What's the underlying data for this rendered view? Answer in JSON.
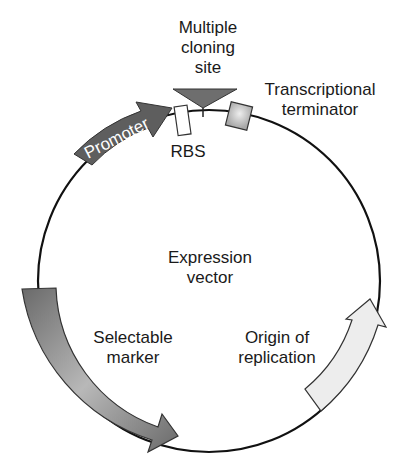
{
  "diagram": {
    "title": "Expression vector",
    "title_lines": [
      "Expression",
      "vector"
    ],
    "elements": {
      "mcs": {
        "lines": [
          "Multiple",
          "cloning",
          "site"
        ],
        "color": "#6e6e6e"
      },
      "terminator": {
        "lines": [
          "Transcriptional",
          "terminator"
        ],
        "color": "#b5b5b5"
      },
      "promoter": {
        "label": "Promoter",
        "color": "#5e5e5e"
      },
      "rbs": {
        "label": "RBS",
        "color": "#ffffff"
      },
      "selectable_marker": {
        "lines": [
          "Selectable",
          "marker"
        ],
        "color": "#7a7a7a"
      },
      "origin": {
        "lines": [
          "Origin of",
          "replication"
        ],
        "color": "#ececec"
      }
    }
  }
}
